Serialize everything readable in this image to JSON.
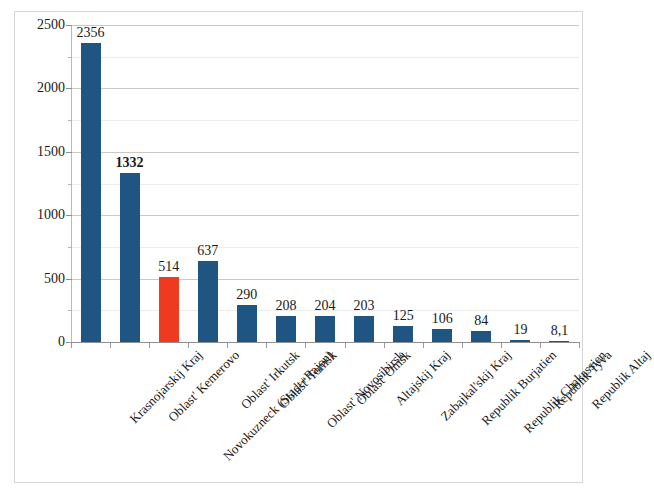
{
  "chart_data": {
    "type": "bar",
    "title": "",
    "subtitle": "",
    "xlabel": "",
    "ylabel": "",
    "ylim": [
      0,
      2500
    ],
    "grid": true,
    "legend": false,
    "y_ticks": [
      "0",
      "500",
      "1000",
      "1500",
      "2000",
      "2500"
    ],
    "y_tick_values": [
      0,
      500,
      1000,
      1500,
      2000,
      2500
    ],
    "y_minor_tick_values": [
      250,
      750,
      1250,
      1750,
      2250
    ],
    "categories": [
      "Krasnojarskij Kraj",
      "Oblast' Kemerovo",
      "Novokuzneck (Stadt+Rajon)",
      "Oblast' Irkutsk",
      "Oblast' Tomsk",
      "Oblast' Novosibirsk",
      "Oblast' Omsk",
      "Altajskij Kraj",
      "Zabajkal'skij Kraj",
      "Republik Burjatien",
      "Republik Chakassien",
      "Republik Tyva",
      "Republik Altaj"
    ],
    "values": [
      2356,
      1332,
      514,
      637,
      290,
      208,
      204,
      203,
      125,
      106,
      84,
      19,
      8.1
    ],
    "value_labels": [
      "2356",
      "1332",
      "514",
      "637",
      "290",
      "208",
      "204",
      "203",
      "125",
      "106",
      "84",
      "19",
      "8,1"
    ],
    "label_bold": [
      false,
      true,
      false,
      false,
      false,
      false,
      false,
      false,
      false,
      false,
      false,
      false,
      false
    ],
    "bar_colors": [
      "#1F5582",
      "#1F5582",
      "#EE3B20",
      "#1F5582",
      "#1F5582",
      "#1F5582",
      "#1F5582",
      "#1F5582",
      "#1F5582",
      "#1F5582",
      "#1F5582",
      "#1F5582",
      "#1F5582"
    ],
    "highlight_index": 2,
    "colors": {
      "series_default": "#1F5582",
      "highlight": "#EE3B20",
      "gridline": "#c9c9c9",
      "gridline_minor": "#ececec",
      "axis": "#8f8f8f",
      "text": "#1a1a1a",
      "frame": "#d6d6d6",
      "background": "#ffffff"
    }
  }
}
